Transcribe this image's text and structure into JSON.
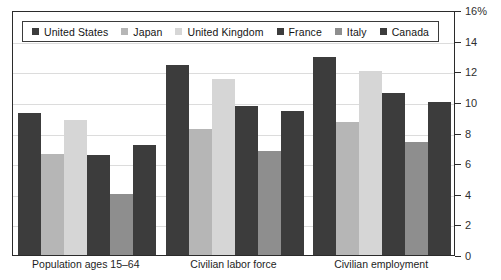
{
  "chart_data": {
    "type": "bar",
    "title": "",
    "xlabel": "",
    "ylabel": "",
    "ylim": [
      0,
      16
    ],
    "ytick_values": [
      0,
      2,
      4,
      6,
      8,
      10,
      12,
      14,
      16
    ],
    "ytick_labels": [
      "0",
      "2",
      "4",
      "6",
      "8",
      "10",
      "12",
      "14",
      "16%"
    ],
    "grid": true,
    "legend_position": "top-left",
    "categories": [
      "Population ages 15–64",
      "Civilian labor force",
      "Civilian employment"
    ],
    "series": [
      {
        "name": "United States",
        "color": "#3c3c3c",
        "values": [
          9.3,
          12.4,
          12.9
        ]
      },
      {
        "name": "Japan",
        "color": "#b6b6b6",
        "values": [
          6.6,
          8.2,
          8.7
        ]
      },
      {
        "name": "United Kingdom",
        "color": "#d6d6d6",
        "values": [
          8.8,
          11.5,
          12.0
        ]
      },
      {
        "name": "France",
        "color": "#3c3c3c",
        "values": [
          6.5,
          9.7,
          10.6
        ]
      },
      {
        "name": "Italy",
        "color": "#8e8e8e",
        "values": [
          4.0,
          6.8,
          7.4
        ]
      },
      {
        "name": "Canada",
        "color": "#3c3c3c",
        "values": [
          7.2,
          9.4,
          10.0
        ]
      }
    ]
  },
  "axis": {
    "unit_suffix": "%"
  },
  "title_sliver": {
    "text": ""
  }
}
